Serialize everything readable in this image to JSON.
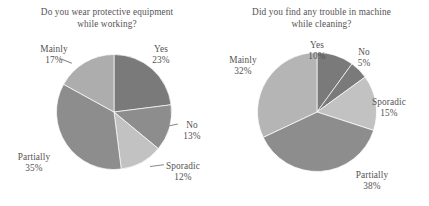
{
  "chart_data": [
    {
      "type": "pie",
      "title": "Do you wear protective equipment while working?",
      "title_line1": "Do you wear protective equipment",
      "title_line2": "while working?",
      "categories": [
        "Yes",
        "No",
        "Sporadic",
        "Partially",
        "Mainly"
      ],
      "values": [
        23,
        13,
        12,
        35,
        17
      ],
      "value_labels": [
        "23%",
        "13%",
        "12%",
        "35%",
        "17%"
      ],
      "colors": [
        "#7a7a7a",
        "#8d8d8d",
        "#c2c2c2",
        "#8d8d8d",
        "#adadad"
      ],
      "start_angle": 0,
      "direction": "clockwise",
      "legend": "none",
      "grid": false
    },
    {
      "type": "pie",
      "title": "Did you find any trouble in machine while cleaning?",
      "title_line1": "Did you find any trouble in machine",
      "title_line2": "while cleaning?",
      "categories": [
        "Yes",
        "No",
        "Sporadic",
        "Partially",
        "Mainly"
      ],
      "values": [
        10,
        5,
        15,
        38,
        32
      ],
      "value_labels": [
        "10%",
        "5%",
        "15%",
        "38%",
        "32%"
      ],
      "colors": [
        "#7a7a7a",
        "#7a7a7a",
        "#c2c2c2",
        "#8d8d8d",
        "#b5b5b5"
      ],
      "start_angle": 0,
      "direction": "clockwise",
      "legend": "none",
      "grid": false
    }
  ],
  "chart1": {
    "title_line1": "Do you wear protective equipment",
    "title_line2": "while working?",
    "labels": {
      "mainly_name": "Mainly",
      "mainly_pct": "17%",
      "yes_name": "Yes",
      "yes_pct": "23%",
      "no_name": "No",
      "no_pct": "13%",
      "sporadic_name": "Sporadic",
      "sporadic_pct": "12%",
      "partially_name": "Partially",
      "partially_pct": "35%"
    }
  },
  "chart2": {
    "title_line1": "Did you find any trouble in machine",
    "title_line2": "while cleaning?",
    "labels": {
      "mainly_name": "Mainly",
      "mainly_pct": "32%",
      "yes_name": "Yes",
      "yes_pct": "10%",
      "no_name": "No",
      "no_pct": "5%",
      "sporadic_name": "Sporadic",
      "sporadic_pct": "15%",
      "partially_name": "Partially",
      "partially_pct": "38%"
    }
  }
}
